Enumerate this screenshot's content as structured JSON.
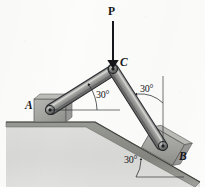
{
  "figure": {
    "type": "statics-mechanism-diagram",
    "background_color": "#fcfcfb",
    "ink_color": "#15161a",
    "bar_fill_color": "#9a9a97",
    "bar_edge_color": "#2c2d30",
    "ground_fill_color": "#8c8d8a",
    "support_fill_color": "#a9aaa6"
  },
  "labels": {
    "force": "P",
    "joint_c": "C",
    "joint_a": "A",
    "joint_b": "B",
    "angle_ac": "30°",
    "angle_cb": "30°",
    "angle_incline": "30°"
  },
  "geometry": {
    "point_a": [
      50,
      110
    ],
    "point_b": [
      163,
      146
    ],
    "point_c": [
      113,
      69
    ],
    "force_arrow_from": [
      113,
      21
    ],
    "force_arrow_to": [
      113,
      67
    ],
    "horizontal_reference_at_a": "dashed-thin line from A rightward",
    "vertical_reference_at_b": "thin line above B",
    "incline_angle_deg": 30,
    "bar_ac_angle_deg": 30,
    "bar_cb_angle_from_vertical_deg": 30
  },
  "icons": {
    "force_arrow": "down-arrow-icon",
    "pin_support_a": "pin-support-icon",
    "pin_support_b": "pin-support-icon"
  }
}
